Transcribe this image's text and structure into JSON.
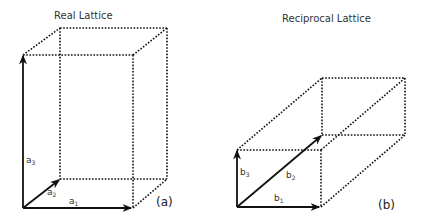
{
  "diagram": {
    "panels": [
      {
        "id": "a",
        "title": "Real Lattice",
        "label": "(a)",
        "vectors": [
          {
            "name": "a",
            "sub": "1"
          },
          {
            "name": "a",
            "sub": "2"
          },
          {
            "name": "a",
            "sub": "3"
          }
        ]
      },
      {
        "id": "b",
        "title": "Reciprocal Lattice",
        "label": "(b)",
        "vectors": [
          {
            "name": "b",
            "sub": "1"
          },
          {
            "name": "b",
            "sub": "2"
          },
          {
            "name": "b",
            "sub": "3"
          }
        ]
      }
    ],
    "colors": {
      "line": "#111111",
      "text": "#333333",
      "background": "#ffffff"
    }
  }
}
